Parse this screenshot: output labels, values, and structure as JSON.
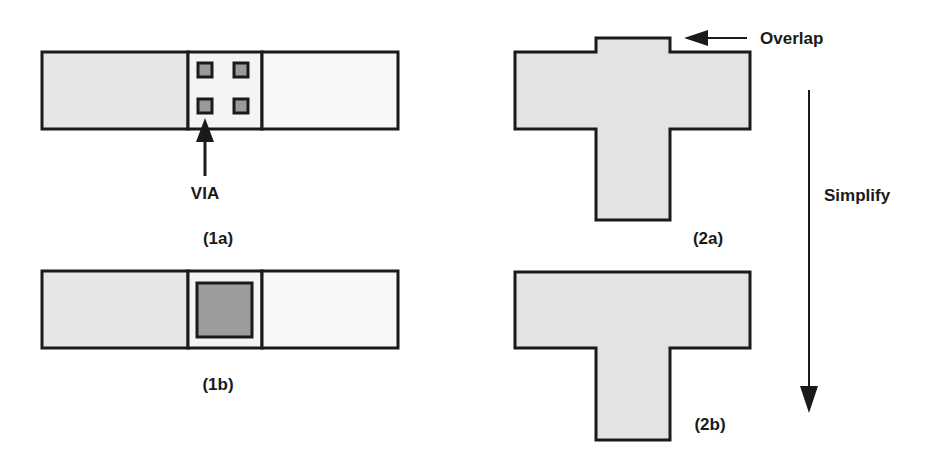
{
  "colors": {
    "background": "#ffffff",
    "stroke": "#1a1a1a",
    "metal_left_fill": "#e6e6e6",
    "metal_mid_fill": "#f4f4f4",
    "metal_right_fill": "#f7f7f7",
    "via_fill": "#9a9a9a",
    "merged_via_fill": "#9c9c9c",
    "polygon_fill": "#e3e3e3"
  },
  "panel_1a": {
    "label": "(1a)",
    "via_label": "VIA",
    "via_count": 4
  },
  "panel_1b": {
    "label": "(1b)"
  },
  "panel_2a": {
    "label": "(2a)",
    "overlap_label": "Overlap"
  },
  "panel_2b": {
    "label": "(2b)"
  },
  "process_arrow": {
    "label": "Simplify"
  }
}
